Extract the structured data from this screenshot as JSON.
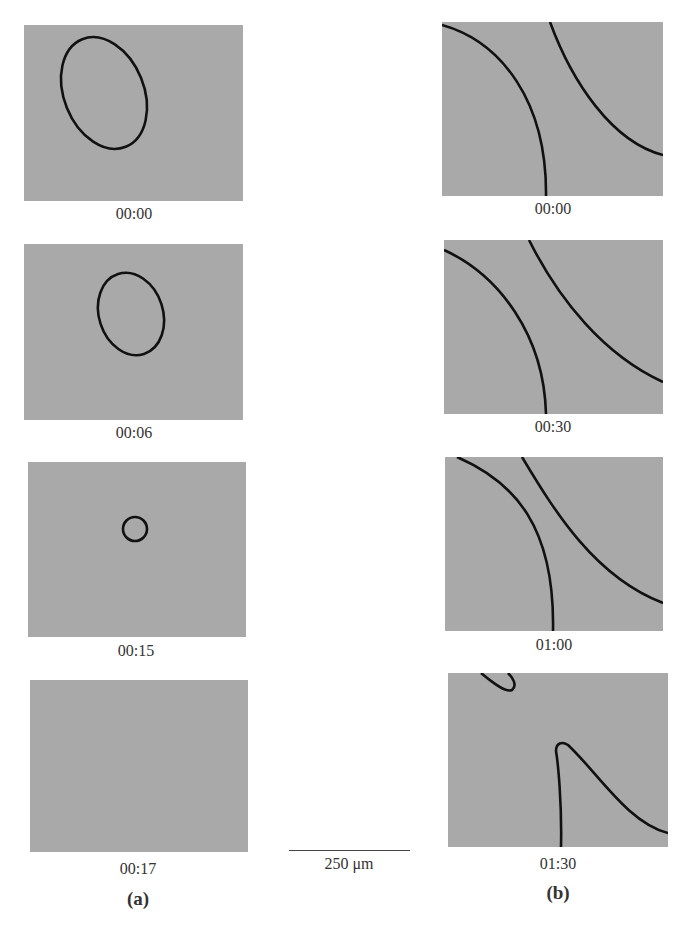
{
  "figure": {
    "column_a": {
      "label": "(a)",
      "frames": [
        {
          "time": "00:00",
          "shape": "large tilted ellipse"
        },
        {
          "time": "00:06",
          "shape": "smaller tilted ellipse"
        },
        {
          "time": "00:15",
          "shape": "small circle"
        },
        {
          "time": "00:17",
          "shape": "empty"
        }
      ]
    },
    "column_b": {
      "label": "(b)",
      "frames": [
        {
          "time": "00:00",
          "shape": "two curves"
        },
        {
          "time": "00:30",
          "shape": "two curves"
        },
        {
          "time": "01:00",
          "shape": "two curves"
        },
        {
          "time": "01:30",
          "shape": "two separated curve fragments"
        }
      ]
    },
    "scale_bar": {
      "label": "250 μm"
    },
    "colors": {
      "panel": "#a9a9a9",
      "curve": "#111111"
    }
  }
}
